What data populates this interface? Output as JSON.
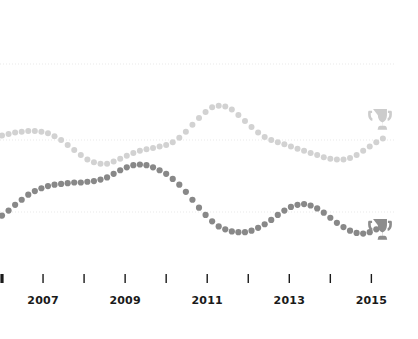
{
  "chart_data": {
    "type": "line",
    "title": "",
    "subtitle": "",
    "xlabel": "",
    "ylabel": "",
    "xlim": [
      2006.0,
      2015.6
    ],
    "grid": true,
    "grid_orientation": "horizontal",
    "grid_style": "dotted",
    "legend_position": "none",
    "marker": "dot",
    "line_style": "dotted-markers",
    "x_tick_values": [
      2006,
      2007,
      2008,
      2009,
      2010,
      2011,
      2012,
      2013,
      2014,
      2015
    ],
    "x_tick_labels": [
      "",
      "2007",
      "",
      "2009",
      "",
      "2011",
      "",
      "2013",
      "",
      "2015"
    ],
    "gridline_values": [
      1,
      2,
      3
    ],
    "series": [
      {
        "name": "upper-series",
        "color": "#d2d2d2",
        "end_marker": "trophy-icon",
        "x": [
          2006.0,
          2006.16,
          2006.32,
          2006.48,
          2006.64,
          2006.8,
          2006.96,
          2007.12,
          2007.28,
          2007.44,
          2007.6,
          2007.76,
          2007.92,
          2008.08,
          2008.24,
          2008.4,
          2008.56,
          2008.72,
          2008.88,
          2009.04,
          2009.2,
          2009.36,
          2009.52,
          2009.68,
          2009.84,
          2010.0,
          2010.16,
          2010.32,
          2010.48,
          2010.64,
          2010.8,
          2010.96,
          2011.12,
          2011.28,
          2011.44,
          2011.6,
          2011.76,
          2011.92,
          2012.08,
          2012.24,
          2012.4,
          2012.56,
          2012.72,
          2012.88,
          2013.04,
          2013.2,
          2013.36,
          2013.52,
          2013.68,
          2013.84,
          2014.0,
          2014.16,
          2014.32,
          2014.48,
          2014.64,
          2014.8,
          2014.96,
          2015.12,
          2015.28
        ],
        "y": [
          2.06,
          2.08,
          2.1,
          2.11,
          2.12,
          2.12,
          2.11,
          2.09,
          2.05,
          2.0,
          1.93,
          1.86,
          1.79,
          1.73,
          1.69,
          1.67,
          1.67,
          1.7,
          1.74,
          1.78,
          1.82,
          1.85,
          1.87,
          1.89,
          1.91,
          1.93,
          1.97,
          2.03,
          2.11,
          2.2,
          2.29,
          2.37,
          2.43,
          2.45,
          2.44,
          2.4,
          2.33,
          2.25,
          2.17,
          2.1,
          2.04,
          2.0,
          1.97,
          1.94,
          1.91,
          1.88,
          1.85,
          1.82,
          1.79,
          1.76,
          1.74,
          1.73,
          1.73,
          1.75,
          1.79,
          1.85,
          1.91,
          1.97,
          2.02
        ]
      },
      {
        "name": "lower-series",
        "color": "#888888",
        "end_marker": "trophy-icon",
        "x": [
          2006.0,
          2006.16,
          2006.32,
          2006.48,
          2006.64,
          2006.8,
          2006.96,
          2007.12,
          2007.28,
          2007.44,
          2007.6,
          2007.76,
          2007.92,
          2008.08,
          2008.24,
          2008.4,
          2008.56,
          2008.72,
          2008.88,
          2009.04,
          2009.2,
          2009.36,
          2009.52,
          2009.68,
          2009.84,
          2010.0,
          2010.16,
          2010.32,
          2010.48,
          2010.64,
          2010.8,
          2010.96,
          2011.12,
          2011.28,
          2011.44,
          2011.6,
          2011.76,
          2011.92,
          2012.08,
          2012.24,
          2012.4,
          2012.56,
          2012.72,
          2012.88,
          2013.04,
          2013.2,
          2013.36,
          2013.52,
          2013.68,
          2013.84,
          2014.0,
          2014.16,
          2014.32,
          2014.48,
          2014.64,
          2014.8,
          2014.96,
          2015.12,
          2015.28
        ],
        "y": [
          0.95,
          1.02,
          1.1,
          1.17,
          1.24,
          1.29,
          1.33,
          1.36,
          1.38,
          1.39,
          1.4,
          1.41,
          1.41,
          1.42,
          1.43,
          1.45,
          1.48,
          1.53,
          1.58,
          1.62,
          1.65,
          1.66,
          1.65,
          1.62,
          1.58,
          1.53,
          1.46,
          1.38,
          1.28,
          1.17,
          1.06,
          0.96,
          0.87,
          0.8,
          0.76,
          0.73,
          0.72,
          0.72,
          0.74,
          0.78,
          0.83,
          0.89,
          0.96,
          1.02,
          1.07,
          1.1,
          1.11,
          1.09,
          1.05,
          0.99,
          0.92,
          0.85,
          0.79,
          0.74,
          0.71,
          0.7,
          0.72,
          0.76,
          0.81
        ]
      }
    ]
  },
  "axis": {
    "tick_color": "#1a1a1a",
    "first_tick_bold": true,
    "labels": [
      "2007",
      "2009",
      "2011",
      "2013",
      "2015"
    ]
  },
  "colors": {
    "background": "#ffffff",
    "gridline": "#e9e9e9",
    "upper_series": "#d2d2d2",
    "lower_series": "#888888",
    "upper_trophy": "#cccccc",
    "lower_trophy": "#8c8c8c",
    "tick": "#1a1a1a"
  },
  "icons": {
    "trophy": "trophy-icon"
  }
}
